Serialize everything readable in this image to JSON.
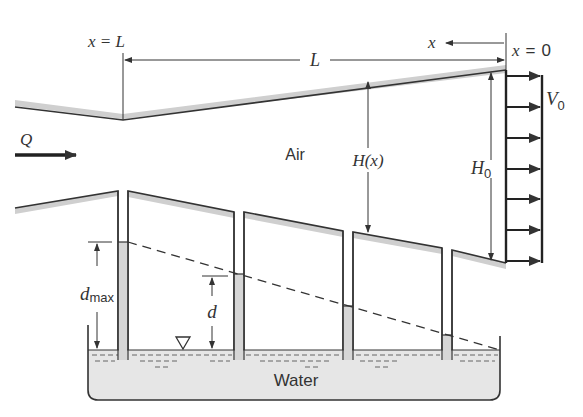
{
  "diagram": {
    "labels": {
      "x_eq_L": "x = L",
      "x_eq_0": "x = 0",
      "x_axis": "x",
      "length": "L",
      "flow": "Q",
      "air": "Air",
      "height_x": "H(x)",
      "height_0_main": "H",
      "height_0_sub": "0",
      "velocity_main": "V",
      "velocity_sub": "0",
      "d_max_main": "d",
      "d_max_sub": "max",
      "d": "d",
      "water": "Water"
    },
    "colors": {
      "line": "#333333",
      "hatch": "#cfcfcf",
      "water": "#e6e6e6",
      "background": "#ffffff"
    },
    "velocity_arrows": 7,
    "manometer_tubes": 4
  }
}
